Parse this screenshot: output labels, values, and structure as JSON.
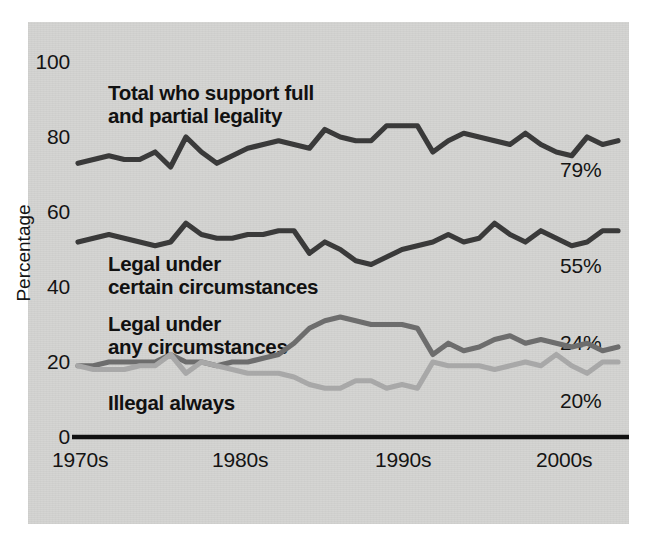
{
  "chart_data": {
    "type": "line",
    "title": "",
    "xlabel": "",
    "ylabel": "Percentage",
    "ylim": [
      0,
      100
    ],
    "yticks": [
      0,
      20,
      40,
      60,
      80,
      100
    ],
    "xticks": [
      "1970s",
      "1980s",
      "1990s",
      "2000s"
    ],
    "grid": false,
    "legend_position": "inline-annotations",
    "x": [
      1973,
      1974,
      1975,
      1976,
      1977,
      1978,
      1979,
      1980,
      1981,
      1983,
      1988,
      1989,
      1990,
      1991,
      1992,
      1993,
      1994,
      1995,
      1996,
      1997,
      1998,
      1999,
      2000,
      2001,
      2002,
      2003,
      2004,
      2005,
      2006,
      2007,
      2008,
      2009,
      2010,
      2011,
      2012,
      2013
    ],
    "series": [
      {
        "name": "Total who support full and partial legality",
        "color": "#3a3a3a",
        "end_value": 79,
        "end_label": "79%",
        "values": [
          73,
          74,
          75,
          74,
          74,
          76,
          72,
          80,
          76,
          73,
          75,
          77,
          78,
          79,
          78,
          77,
          82,
          80,
          79,
          79,
          83,
          83,
          83,
          76,
          79,
          81,
          80,
          79,
          78,
          81,
          78,
          76,
          75,
          80,
          78,
          79
        ]
      },
      {
        "name": "Legal under certain circumstances",
        "color": "#3a3a3a",
        "end_value": 55,
        "end_label": "55%",
        "values": [
          52,
          53,
          54,
          53,
          52,
          51,
          52,
          57,
          54,
          53,
          53,
          54,
          54,
          55,
          55,
          49,
          52,
          50,
          47,
          46,
          48,
          50,
          51,
          52,
          54,
          52,
          53,
          57,
          54,
          52,
          55,
          53,
          51,
          52,
          55,
          55
        ]
      },
      {
        "name": "Legal under any circumstances",
        "color": "#6d6d6d",
        "end_value": 24,
        "end_label": "24%",
        "values": [
          19,
          19,
          20,
          20,
          20,
          20,
          22,
          20,
          20,
          19,
          20,
          20,
          21,
          22,
          25,
          29,
          31,
          32,
          31,
          30,
          30,
          30,
          29,
          22,
          25,
          23,
          24,
          26,
          27,
          25,
          26,
          25,
          24,
          25,
          23,
          24
        ]
      },
      {
        "name": "Illegal always",
        "color": "#a8a8a8",
        "end_value": 20,
        "end_label": "20%",
        "values": [
          19,
          18,
          18,
          18,
          19,
          19,
          22,
          17,
          20,
          19,
          18,
          17,
          17,
          17,
          16,
          14,
          13,
          13,
          15,
          15,
          13,
          14,
          13,
          20,
          19,
          19,
          19,
          18,
          19,
          20,
          19,
          22,
          19,
          17,
          20,
          20
        ]
      }
    ],
    "annotations": [
      {
        "name": "total-support-label",
        "text_line1": "Total who support full",
        "text_line2": "and partial legality"
      },
      {
        "name": "legal-certain-label",
        "text_line1": "Legal under",
        "text_line2": "certain circumstances"
      },
      {
        "name": "legal-any-label",
        "text_line1": "Legal under",
        "text_line2": "any circumstances"
      },
      {
        "name": "illegal-always-label",
        "text_line1": "Illegal always",
        "text_line2": ""
      }
    ]
  },
  "axes": {
    "y_title": "Percentage",
    "y_ticks": [
      "100",
      "80",
      "60",
      "40",
      "20",
      "0"
    ],
    "x_ticks": [
      "1970s",
      "1980s",
      "1990s",
      "2000s"
    ]
  },
  "labels": {
    "total_line1": "Total who support full",
    "total_line2": "and partial legality",
    "certain_line1": "Legal under",
    "certain_line2": "certain circumstances",
    "any_line1": "Legal under",
    "any_line2": "any circumstances",
    "illegal_line1": "Illegal always"
  },
  "values": {
    "total_pct": "79%",
    "certain_pct": "55%",
    "any_pct": "24%",
    "illegal_pct": "20%"
  },
  "colors": {
    "background": "#d4d4d2",
    "axis": "#111111",
    "series_dark": "#3a3a3a",
    "series_mid_gray": "#6d6d6d",
    "series_light_gray": "#a8a8a8"
  }
}
